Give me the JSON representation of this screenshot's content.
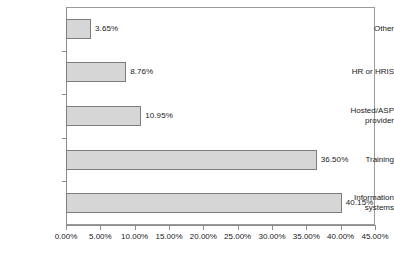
{
  "chart_data": {
    "type": "bar",
    "orientation": "horizontal",
    "title": "",
    "subtitle": "",
    "xlabel": "",
    "ylabel": "",
    "categories": [
      "Other",
      "HR or HRIS",
      "Hosted/ASP provider",
      "Training",
      "Information systems"
    ],
    "values": [
      3.65,
      8.76,
      10.95,
      36.5,
      40.15
    ],
    "data_labels": [
      "3.65%",
      "8.76%",
      "10.95%",
      "36.50%",
      "40.15%"
    ],
    "xlim": [
      0,
      45
    ],
    "xticks": [
      0,
      5,
      10,
      15,
      20,
      25,
      30,
      35,
      40,
      45
    ],
    "xtick_labels": [
      "0.00%",
      "5.00%",
      "10.00%",
      "15.00%",
      "20.00%",
      "25.00%",
      "30.00%",
      "35.00%",
      "40.00%",
      "45.00%"
    ],
    "grid": false,
    "legend": null,
    "bar_fill_color": "#d6d6d6",
    "bar_border_color": "#7d7d7d",
    "axis_color": "#8c8c8c",
    "text_color": "#1a1a1a",
    "background_color": "#ffffff",
    "category_labels_multiline": [
      [
        "Other"
      ],
      [
        "HR or HRIS"
      ],
      [
        "Hosted/ASP",
        "provider"
      ],
      [
        "Training"
      ],
      [
        "Information",
        "systems"
      ]
    ]
  }
}
